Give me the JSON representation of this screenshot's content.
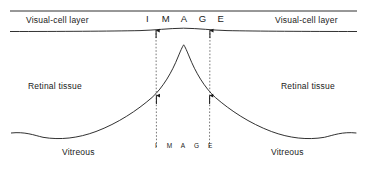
{
  "figure": {
    "type": "anatomical-schematic",
    "labels": {
      "visual_cell_layer_left": "Visual-cell layer",
      "visual_cell_layer_right": "Visual-cell layer",
      "retinal_tissue_left": "Retinal tissue",
      "retinal_tissue_right": "Retinal tissue",
      "vitreous_left": "Vitreous",
      "vitreous_right": "Vitreous"
    },
    "image_top": {
      "word": "IMAGE",
      "letters": [
        "I",
        "M",
        "A",
        "G",
        "E"
      ],
      "note": "magnified image spread across the visual-cell layer"
    },
    "image_bottom": {
      "word": "IMAGE",
      "letters": [
        "I",
        "M",
        "A",
        "G",
        "E"
      ],
      "note": "original image size at the vitreous side"
    },
    "colors": {
      "line": "#1a1a1a",
      "dashed": "#555555",
      "text": "#1a1a1a",
      "background": "#ffffff"
    }
  }
}
